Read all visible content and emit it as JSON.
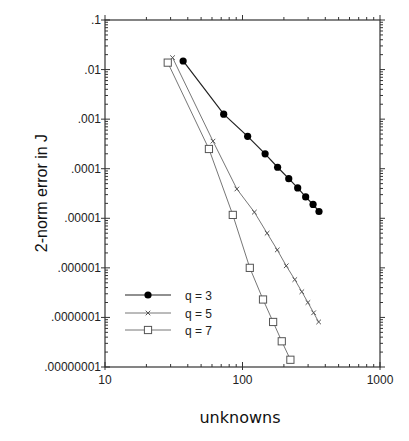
{
  "chart_data": {
    "type": "line",
    "title": "",
    "xlabel": "unknowns",
    "ylabel": "2-norm  error  in  J",
    "xscale": "log",
    "yscale": "log",
    "xlim": [
      10,
      1000
    ],
    "ylim": [
      1e-08,
      0.1
    ],
    "x_tick_labels": [
      "10",
      "100",
      "1000"
    ],
    "y_tick_labels": [
      ".1",
      ".01",
      ".001",
      ".0001",
      ".00001",
      ".000001",
      ".0000001",
      ".00000001"
    ],
    "grid": false,
    "legend_position": "lower-left",
    "series": [
      {
        "name": "q = 3",
        "marker": "filled-circle",
        "color": "#000000",
        "x": [
          37,
          73,
          109,
          146,
          180,
          217,
          252,
          288,
          326,
          360
        ],
        "y": [
          0.0149,
          0.00126,
          0.00045,
          0.0002,
          0.000107,
          6.3e-05,
          4.1e-05,
          2.7e-05,
          1.9e-05,
          1.37e-05
        ]
      },
      {
        "name": "q = 5",
        "marker": "x",
        "color": "#555555",
        "x": [
          31,
          61,
          91,
          122,
          151,
          179,
          208,
          240,
          270,
          299,
          329,
          358
        ],
        "y": [
          0.0174,
          0.00036,
          3.9e-05,
          1.33e-05,
          5e-06,
          2.3e-06,
          1.1e-06,
          5.8e-07,
          3.3e-07,
          2e-07,
          1.24e-07,
          8.1e-08
        ]
      },
      {
        "name": "q = 7",
        "marker": "open-square",
        "color": "#555555",
        "x": [
          28.6,
          57,
          85,
          113,
          141,
          167,
          193,
          223
        ],
        "y": [
          0.0138,
          0.00025,
          1.17e-05,
          1e-06,
          2.3e-07,
          8.1e-08,
          3.3e-08,
          1.4e-08
        ]
      }
    ]
  }
}
